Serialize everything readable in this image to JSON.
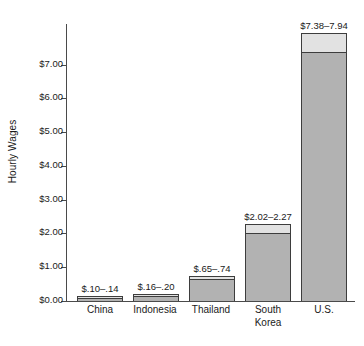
{
  "chart_data": {
    "type": "bar",
    "title": "",
    "xlabel": "",
    "ylabel": "Hourly Wages",
    "ylim": [
      0,
      8.2
    ],
    "grid": false,
    "legend": "none",
    "categories": [
      "China",
      "Indonesia",
      "Thailand",
      "South\nKorea",
      "U.S."
    ],
    "y_ticks": [
      0,
      1,
      2,
      3,
      4,
      5,
      6,
      7
    ],
    "y_tick_labels": [
      "$0.00",
      "$1.00",
      "$2.00",
      "$3.00",
      "$4.00",
      "$5.00",
      "$6.00",
      "$7.00"
    ],
    "series": [
      {
        "name": "Low estimate",
        "values": [
          0.1,
          0.16,
          0.65,
          2.02,
          7.38
        ]
      },
      {
        "name": "High estimate",
        "values": [
          0.14,
          0.2,
          0.74,
          2.27,
          7.94
        ]
      }
    ],
    "data_labels": [
      "$.10–.14",
      "$.16–.20",
      "$.65–.74",
      "$2.02–2.27",
      "$7.38–7.94"
    ],
    "colors": {
      "bar_low": "#b2b2b2",
      "bar_range_cap": "#e2e2e2",
      "bar_outline": "#3d3d3d",
      "axis": "#4a4a4a",
      "text": "#1a1a1a",
      "background": "#ffffff"
    }
  },
  "axis": {
    "y_title": "Hourly Wages"
  },
  "categories": [
    {
      "line1": "China",
      "line2": ""
    },
    {
      "line1": "Indonesia",
      "line2": ""
    },
    {
      "line1": "Thailand",
      "line2": ""
    },
    {
      "line1": "South",
      "line2": "Korea"
    },
    {
      "line1": "U.S.",
      "line2": ""
    }
  ],
  "labels": {
    "china": "$.10–.14",
    "indonesia": "$.16–.20",
    "thailand": "$.65–.74",
    "south_korea": "$2.02–2.27",
    "us": "$7.38–7.94"
  },
  "ticks": {
    "t0": "$0.00",
    "t1": "$1.00",
    "t2": "$2.00",
    "t3": "$3.00",
    "t4": "$4.00",
    "t5": "$5.00",
    "t6": "$6.00",
    "t7": "$7.00"
  }
}
